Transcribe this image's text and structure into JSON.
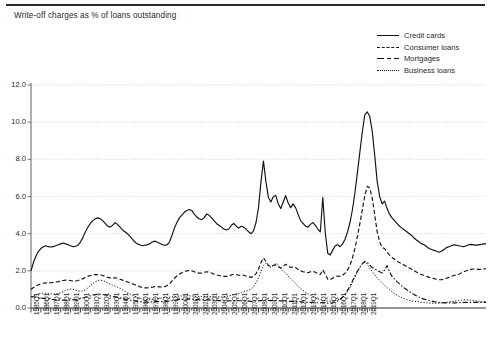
{
  "title": "Write-off charges as % of loans outstanding",
  "legend": [
    {
      "label": "Credit cards",
      "style": "solid"
    },
    {
      "label": "Consumer loans",
      "style": "dashed"
    },
    {
      "label": "Mortgages",
      "style": "dashdot"
    },
    {
      "label": "Business loans",
      "style": "dotted"
    }
  ],
  "chart_data": {
    "type": "line",
    "title": "Write-off charges as % of loans outstanding",
    "xlabel": "",
    "ylabel": "",
    "ylim": [
      0.0,
      12.0
    ],
    "yticks": [
      0.0,
      2.0,
      4.0,
      6.0,
      8.0,
      10.0,
      12.0
    ],
    "ytick_labels": [
      "0.0",
      "2.0",
      "4.0",
      "6.0",
      "8.0",
      "10.0",
      "12.0"
    ],
    "grid": true,
    "grid_axis": "y",
    "legend_position": "top-right",
    "x_tick_labels": [
      "1985Q1",
      "1986Q1",
      "1987Q1",
      "1988Q1",
      "1989Q1",
      "1990Q1",
      "1991Q1",
      "1992Q1",
      "1993Q1",
      "1994Q1",
      "1995Q1",
      "1996Q1",
      "1997Q1",
      "1998Q1",
      "1999Q1",
      "2000Q1",
      "2001Q1",
      "2002Q1",
      "2003Q1",
      "2004Q1",
      "2005Q1",
      "2006Q1",
      "2007Q1",
      "2008Q1",
      "2009Q1",
      "2010Q1",
      "2011Q1",
      "2012Q1",
      "2013Q1",
      "2014Q1",
      "2015Q1",
      "2016Q1",
      "2017Q1",
      "2018Q1",
      "2019Q1"
    ],
    "x_start": "1985Q1",
    "x_end": "2019Q1",
    "x_frequency": "quarterly",
    "series": [
      {
        "name": "Credit cards",
        "style": "solid",
        "color": "#111111",
        "values": [
          2.0,
          2.45,
          2.8,
          3.05,
          3.2,
          3.3,
          3.35,
          3.3,
          3.28,
          3.3,
          3.35,
          3.4,
          3.45,
          3.5,
          3.45,
          3.4,
          3.35,
          3.3,
          3.32,
          3.38,
          3.55,
          3.8,
          4.1,
          4.35,
          4.55,
          4.7,
          4.8,
          4.85,
          4.8,
          4.7,
          4.55,
          4.4,
          4.35,
          4.45,
          4.6,
          4.5,
          4.35,
          4.2,
          4.1,
          4.0,
          3.85,
          3.7,
          3.55,
          3.45,
          3.4,
          3.35,
          3.38,
          3.4,
          3.45,
          3.55,
          3.6,
          3.55,
          3.48,
          3.42,
          3.38,
          3.4,
          3.55,
          3.9,
          4.3,
          4.6,
          4.85,
          5.0,
          5.15,
          5.25,
          5.3,
          5.25,
          5.05,
          4.9,
          4.8,
          4.75,
          4.85,
          5.05,
          5.0,
          4.85,
          4.7,
          4.55,
          4.45,
          4.35,
          4.25,
          4.2,
          4.25,
          4.45,
          4.55,
          4.4,
          4.3,
          4.4,
          4.35,
          4.25,
          4.1,
          4.0,
          4.15,
          4.6,
          5.4,
          6.8,
          7.9,
          6.8,
          5.95,
          5.7,
          6.0,
          6.05,
          5.6,
          5.35,
          5.7,
          6.05,
          5.65,
          5.4,
          5.6,
          5.4,
          5.05,
          4.7,
          4.55,
          4.4,
          4.35,
          4.5,
          4.6,
          4.45,
          4.25,
          4.1,
          5.95,
          4.05,
          2.95,
          2.85,
          3.1,
          3.35,
          3.4,
          3.3,
          3.45,
          3.7,
          4.1,
          4.6,
          5.3,
          6.2,
          7.3,
          8.4,
          9.5,
          10.4,
          10.55,
          10.3,
          9.5,
          8.2,
          6.8,
          6.0,
          5.6,
          5.75,
          5.35,
          5.05,
          4.85,
          4.7,
          4.55,
          4.4,
          4.3,
          4.2,
          4.1,
          4.0,
          3.9,
          3.75,
          3.65,
          3.55,
          3.45,
          3.4,
          3.3,
          3.2,
          3.15,
          3.1,
          3.05,
          3.0,
          3.05,
          3.15,
          3.25,
          3.3,
          3.35,
          3.4,
          3.38,
          3.35,
          3.32,
          3.3,
          3.35,
          3.4,
          3.42,
          3.4,
          3.38,
          3.4,
          3.42,
          3.45,
          3.45
        ]
      },
      {
        "name": "Consumer loans",
        "style": "dashed",
        "color": "#111111",
        "values": [
          1.0,
          1.1,
          1.18,
          1.25,
          1.3,
          1.33,
          1.35,
          1.35,
          1.36,
          1.38,
          1.4,
          1.42,
          1.45,
          1.48,
          1.5,
          1.5,
          1.48,
          1.45,
          1.45,
          1.48,
          1.52,
          1.58,
          1.65,
          1.7,
          1.75,
          1.78,
          1.8,
          1.8,
          1.78,
          1.75,
          1.7,
          1.65,
          1.62,
          1.62,
          1.63,
          1.6,
          1.55,
          1.5,
          1.45,
          1.4,
          1.35,
          1.3,
          1.25,
          1.2,
          1.15,
          1.1,
          1.08,
          1.08,
          1.1,
          1.12,
          1.15,
          1.15,
          1.14,
          1.13,
          1.15,
          1.2,
          1.3,
          1.45,
          1.6,
          1.72,
          1.82,
          1.9,
          1.95,
          2.0,
          2.02,
          2.0,
          1.95,
          1.9,
          1.88,
          1.88,
          1.92,
          1.95,
          1.92,
          1.88,
          1.82,
          1.78,
          1.75,
          1.72,
          1.7,
          1.7,
          1.72,
          1.78,
          1.82,
          1.8,
          1.76,
          1.78,
          1.76,
          1.72,
          1.68,
          1.65,
          1.7,
          1.85,
          2.1,
          2.45,
          2.7,
          2.5,
          2.3,
          2.22,
          2.3,
          2.32,
          2.22,
          2.15,
          2.25,
          2.35,
          2.25,
          2.18,
          2.22,
          2.18,
          2.08,
          2.0,
          1.95,
          1.92,
          1.9,
          1.95,
          1.98,
          1.92,
          1.85,
          1.8,
          2.05,
          1.82,
          1.55,
          1.52,
          1.6,
          1.7,
          1.72,
          1.7,
          1.76,
          1.88,
          2.05,
          2.3,
          2.7,
          3.2,
          3.85,
          4.55,
          5.3,
          6.05,
          6.55,
          6.45,
          5.9,
          5.0,
          4.1,
          3.55,
          3.25,
          3.2,
          3.0,
          2.85,
          2.72,
          2.62,
          2.52,
          2.45,
          2.38,
          2.3,
          2.22,
          2.15,
          2.08,
          2.0,
          1.92,
          1.85,
          1.8,
          1.75,
          1.7,
          1.65,
          1.62,
          1.58,
          1.55,
          1.52,
          1.52,
          1.55,
          1.6,
          1.65,
          1.7,
          1.75,
          1.78,
          1.82,
          1.88,
          1.95,
          2.0,
          2.05,
          2.08,
          2.1,
          2.1,
          2.08,
          2.08,
          2.1,
          2.12
        ]
      },
      {
        "name": "Mortgages",
        "style": "dashdot",
        "color": "#111111",
        "values": [
          0.62,
          0.6,
          0.58,
          0.56,
          0.54,
          0.52,
          0.5,
          0.48,
          0.46,
          0.45,
          0.44,
          0.43,
          0.42,
          0.42,
          0.42,
          0.42,
          0.43,
          0.44,
          0.45,
          0.47,
          0.5,
          0.54,
          0.58,
          0.62,
          0.66,
          0.7,
          0.72,
          0.74,
          0.74,
          0.73,
          0.71,
          0.68,
          0.65,
          0.62,
          0.6,
          0.57,
          0.54,
          0.51,
          0.48,
          0.45,
          0.42,
          0.4,
          0.38,
          0.36,
          0.34,
          0.33,
          0.32,
          0.32,
          0.32,
          0.33,
          0.34,
          0.34,
          0.34,
          0.34,
          0.35,
          0.36,
          0.38,
          0.4,
          0.42,
          0.44,
          0.45,
          0.46,
          0.47,
          0.48,
          0.48,
          0.47,
          0.46,
          0.45,
          0.44,
          0.44,
          0.44,
          0.44,
          0.44,
          0.43,
          0.42,
          0.41,
          0.4,
          0.39,
          0.38,
          0.38,
          0.38,
          0.39,
          0.4,
          0.4,
          0.39,
          0.39,
          0.39,
          0.38,
          0.37,
          0.36,
          0.36,
          0.37,
          0.38,
          0.4,
          0.42,
          0.42,
          0.41,
          0.4,
          0.4,
          0.4,
          0.39,
          0.38,
          0.38,
          0.38,
          0.37,
          0.36,
          0.36,
          0.35,
          0.34,
          0.33,
          0.32,
          0.31,
          0.3,
          0.3,
          0.3,
          0.29,
          0.28,
          0.28,
          0.3,
          0.28,
          0.26,
          0.26,
          0.28,
          0.32,
          0.38,
          0.46,
          0.58,
          0.75,
          0.95,
          1.18,
          1.45,
          1.72,
          1.98,
          2.2,
          2.38,
          2.5,
          2.45,
          2.3,
          2.18,
          2.1,
          2.02,
          1.95,
          1.88,
          2.05,
          2.28,
          1.95,
          1.7,
          1.55,
          1.42,
          1.3,
          1.18,
          1.08,
          0.98,
          0.88,
          0.8,
          0.72,
          0.65,
          0.58,
          0.52,
          0.48,
          0.44,
          0.4,
          0.37,
          0.34,
          0.32,
          0.3,
          0.29,
          0.28,
          0.28,
          0.28,
          0.28,
          0.28,
          0.28,
          0.29,
          0.3,
          0.3,
          0.3,
          0.3,
          0.3,
          0.3,
          0.3,
          0.3,
          0.3,
          0.3,
          0.3
        ]
      },
      {
        "name": "Business loans",
        "style": "dotted",
        "color": "#111111",
        "values": [
          0.6,
          0.65,
          0.7,
          0.75,
          0.78,
          0.8,
          0.8,
          0.78,
          0.76,
          0.75,
          0.76,
          0.78,
          0.82,
          0.88,
          0.95,
          1.0,
          1.02,
          1.0,
          0.96,
          0.92,
          0.9,
          0.92,
          0.98,
          1.08,
          1.2,
          1.32,
          1.42,
          1.48,
          1.5,
          1.48,
          1.42,
          1.35,
          1.28,
          1.22,
          1.18,
          1.12,
          1.05,
          0.98,
          0.9,
          0.82,
          0.75,
          0.68,
          0.62,
          0.56,
          0.52,
          0.48,
          0.46,
          0.45,
          0.45,
          0.46,
          0.48,
          0.5,
          0.52,
          0.54,
          0.55,
          0.56,
          0.58,
          0.6,
          0.62,
          0.63,
          0.64,
          0.65,
          0.66,
          0.66,
          0.66,
          0.65,
          0.64,
          0.63,
          0.62,
          0.62,
          0.62,
          0.62,
          0.62,
          0.61,
          0.6,
          0.6,
          0.6,
          0.6,
          0.6,
          0.62,
          0.65,
          0.68,
          0.72,
          0.75,
          0.78,
          0.82,
          0.86,
          0.9,
          0.95,
          1.02,
          1.15,
          1.35,
          1.62,
          1.95,
          2.3,
          2.4,
          2.25,
          2.18,
          2.3,
          2.42,
          2.28,
          2.12,
          2.0,
          1.88,
          1.72,
          1.58,
          1.45,
          1.32,
          1.18,
          1.05,
          0.95,
          0.85,
          0.76,
          0.68,
          0.62,
          0.56,
          0.5,
          0.45,
          0.42,
          0.4,
          0.38,
          0.37,
          0.38,
          0.4,
          0.44,
          0.5,
          0.58,
          0.7,
          0.88,
          1.1,
          1.38,
          1.68,
          1.95,
          2.18,
          2.38,
          2.48,
          2.35,
          2.15,
          1.95,
          1.78,
          1.62,
          1.48,
          1.35,
          1.22,
          1.1,
          0.98,
          0.88,
          0.78,
          0.7,
          0.62,
          0.55,
          0.5,
          0.45,
          0.42,
          0.38,
          0.36,
          0.34,
          0.32,
          0.3,
          0.29,
          0.28,
          0.27,
          0.26,
          0.26,
          0.26,
          0.26,
          0.27,
          0.28,
          0.3,
          0.32,
          0.34,
          0.36,
          0.38,
          0.4,
          0.42,
          0.44,
          0.44,
          0.43,
          0.42,
          0.4,
          0.38,
          0.36,
          0.35,
          0.34,
          0.34
        ]
      }
    ]
  }
}
